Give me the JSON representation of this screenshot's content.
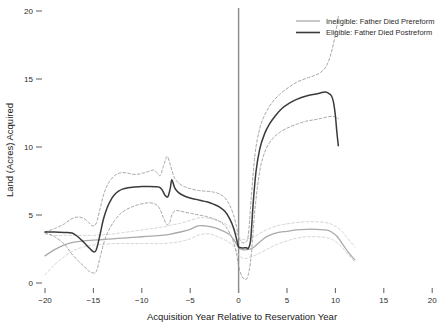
{
  "chart_data": {
    "type": "line",
    "title": "",
    "xlabel": "Acquisition Year Relative to Reservation Year",
    "ylabel": "Land (Acres) Acquired",
    "xlim": [
      -20,
      20
    ],
    "ylim": [
      0,
      20
    ],
    "xticks": [
      -20,
      -15,
      -10,
      -5,
      0,
      5,
      10,
      15,
      20
    ],
    "xtick_labels": [
      "−20",
      "−15",
      "−10",
      "−5",
      "0",
      "5",
      "10",
      "15",
      "20"
    ],
    "yticks": [
      0,
      5,
      10,
      15,
      20
    ],
    "ytick_labels": [
      "0",
      "5",
      "10",
      "15",
      "20"
    ],
    "grid": false,
    "legend_position": "top-right",
    "vertical_reference_line": {
      "x": 0,
      "label": "Reservation Year",
      "color": "#8a8a8a"
    },
    "colors": {
      "eligible": "#3a3a3a",
      "ineligible": "#aaaaaa",
      "eligible_ci": "#9b9b9b",
      "ineligible_ci": "#cfcfcf",
      "axis": "#4a4a4a",
      "text": "#2b2b2b"
    },
    "series": [
      {
        "name": "Ineligible: Father Died Prereform",
        "style": "solid",
        "color": "#aaaaaa",
        "x": [
          -20,
          -19,
          -18,
          -17,
          -16,
          -15,
          -14,
          -13,
          -12,
          -11,
          -10,
          -9,
          -8,
          -7,
          -6,
          -5,
          -4.2,
          -3.5,
          -3,
          -2,
          -1,
          -0.5,
          0,
          0.4,
          0.8,
          1.2,
          1.6,
          2,
          2.5,
          3,
          4,
          5,
          6,
          7,
          8,
          9,
          9.6,
          10.2,
          10.8,
          11.4,
          12
        ],
        "y": [
          2.0,
          2.45,
          2.8,
          3.0,
          3.1,
          3.15,
          3.2,
          3.25,
          3.3,
          3.35,
          3.4,
          3.45,
          3.5,
          3.6,
          3.75,
          3.95,
          4.2,
          4.2,
          4.15,
          3.95,
          3.6,
          3.2,
          2.6,
          2.45,
          2.45,
          2.5,
          2.65,
          2.9,
          3.2,
          3.45,
          3.7,
          3.8,
          3.9,
          3.95,
          3.95,
          3.9,
          3.75,
          3.4,
          2.8,
          2.2,
          1.7
        ]
      },
      {
        "name": "Eligible: Father Died Postreform",
        "style": "solid",
        "color": "#3a3a3a",
        "x": [
          -20,
          -19,
          -18,
          -17.2,
          -16.6,
          -16,
          -15.4,
          -15,
          -14.7,
          -14.3,
          -14,
          -13.6,
          -13.2,
          -12.8,
          -12.4,
          -12,
          -11.4,
          -10.8,
          -10,
          -9.2,
          -8.6,
          -8.2,
          -7.9,
          -7.6,
          -7.3,
          -7.05,
          -6.9,
          -6.6,
          -6.2,
          -5.6,
          -5,
          -4.4,
          -3.8,
          -3.2,
          -2.6,
          -2,
          -1.4,
          -0.9,
          -0.5,
          -0.2,
          0,
          0.25,
          0.5,
          0.8,
          1.0,
          1.25,
          1.5,
          1.8,
          2.2,
          2.7,
          3.2,
          3.8,
          4.5,
          5.2,
          6,
          7,
          8,
          8.6,
          9.0,
          9.3,
          9.6,
          9.8,
          10.0,
          10.15,
          10.3
        ],
        "y": [
          3.75,
          3.75,
          3.72,
          3.68,
          3.4,
          3.0,
          2.55,
          2.3,
          2.45,
          3.6,
          4.6,
          5.5,
          6.1,
          6.5,
          6.75,
          6.9,
          7.0,
          7.05,
          7.1,
          7.1,
          7.08,
          7.05,
          6.85,
          6.45,
          6.35,
          7.0,
          7.6,
          7.0,
          6.65,
          6.4,
          6.25,
          6.15,
          6.05,
          5.95,
          5.8,
          5.6,
          5.25,
          4.7,
          4.0,
          3.2,
          2.65,
          2.6,
          2.58,
          2.6,
          2.55,
          3.2,
          5.8,
          8.2,
          9.9,
          11.0,
          11.7,
          12.3,
          12.85,
          13.2,
          13.5,
          13.75,
          13.9,
          14.0,
          14.05,
          13.95,
          13.75,
          13.3,
          12.3,
          11.1,
          10.1
        ]
      }
    ],
    "confidence_bands": [
      {
        "name": "Ineligible: Father Died Prereform CI upper",
        "belongs_to": "Ineligible: Father Died Prereform",
        "style": "dashed",
        "color": "#cfcfcf",
        "x": [
          -20,
          -19,
          -18,
          -17,
          -16,
          -15,
          -14,
          -13,
          -12,
          -11,
          -10,
          -9,
          -8,
          -7,
          -6,
          -5,
          -4,
          -3,
          -2,
          -1,
          -0.4,
          0,
          0.5,
          1,
          1.6,
          2.2,
          3,
          4,
          5,
          6,
          7,
          8,
          9,
          9.8,
          10.6,
          11.3,
          12
        ],
        "y": [
          3.6,
          3.5,
          3.5,
          3.5,
          3.5,
          3.5,
          3.55,
          3.6,
          3.7,
          3.8,
          3.9,
          4.0,
          4.1,
          4.25,
          4.4,
          4.6,
          4.8,
          4.75,
          4.55,
          4.2,
          3.85,
          3.4,
          3.2,
          3.25,
          3.4,
          3.65,
          3.95,
          4.2,
          4.35,
          4.45,
          4.5,
          4.5,
          4.45,
          4.25,
          3.85,
          3.25,
          2.65
        ]
      },
      {
        "name": "Ineligible: Father Died Prereform CI lower",
        "belongs_to": "Ineligible: Father Died Prereform",
        "style": "dashed",
        "color": "#cfcfcf",
        "x": [
          -20,
          -19,
          -18,
          -17,
          -16,
          -15,
          -14,
          -13,
          -12,
          -11,
          -10,
          -9,
          -8,
          -7,
          -6,
          -5,
          -4,
          -3,
          -2,
          -1,
          -0.4,
          0,
          0.5,
          1,
          1.6,
          2.2,
          3,
          4,
          5,
          6,
          7,
          8,
          9,
          9.8,
          10.6,
          11.3,
          12
        ],
        "y": [
          0.6,
          1.35,
          1.95,
          2.4,
          2.65,
          2.8,
          2.85,
          2.9,
          2.9,
          2.9,
          2.9,
          2.9,
          2.9,
          2.95,
          3.05,
          3.25,
          3.55,
          3.6,
          3.35,
          3.0,
          2.6,
          2.05,
          1.8,
          1.85,
          2.0,
          2.2,
          2.5,
          2.85,
          3.1,
          3.3,
          3.4,
          3.4,
          3.35,
          3.15,
          2.7,
          2.1,
          1.55
        ]
      },
      {
        "name": "Eligible: Father Died Postreform CI upper",
        "belongs_to": "Eligible: Father Died Postreform",
        "style": "dashed",
        "color": "#9b9b9b",
        "x": [
          -20,
          -19,
          -18,
          -17.3,
          -16.6,
          -16,
          -15.5,
          -15.1,
          -14.7,
          -14.3,
          -13.9,
          -13.4,
          -12.8,
          -12.2,
          -11.6,
          -11,
          -10.4,
          -9.8,
          -9.3,
          -8.8,
          -8.4,
          -8.1,
          -7.8,
          -7.4,
          -7.1,
          -6.9,
          -6.6,
          -6.1,
          -5.5,
          -4.8,
          -4.1,
          -3.4,
          -2.7,
          -2,
          -1.4,
          -0.9,
          -0.5,
          -0.2,
          0,
          0.3,
          0.7,
          1.0,
          1.3,
          1.7,
          2.2,
          2.8,
          3.5,
          4.3,
          5.2,
          6.1,
          7,
          7.8,
          8.5,
          9.1,
          9.6,
          10,
          10.3
        ],
        "y": [
          3.75,
          4.0,
          4.35,
          4.7,
          4.85,
          4.75,
          4.45,
          4.2,
          4.4,
          5.5,
          6.6,
          7.4,
          7.9,
          8.1,
          8.1,
          8.0,
          8.0,
          8.1,
          8.2,
          8.3,
          8.1,
          7.9,
          8.5,
          9.3,
          8.8,
          8.3,
          7.7,
          7.3,
          7.05,
          6.9,
          6.8,
          6.75,
          6.7,
          6.55,
          6.25,
          5.7,
          4.95,
          4.1,
          3.4,
          3.0,
          3.0,
          3.5,
          6.2,
          9.5,
          11.4,
          12.5,
          13.3,
          13.9,
          14.4,
          14.8,
          15.05,
          15.25,
          15.5,
          16.0,
          17.0,
          18.3,
          19.6
        ]
      },
      {
        "name": "Eligible: Father Died Postreform CI lower",
        "belongs_to": "Eligible: Father Died Postreform",
        "style": "dashed",
        "color": "#9b9b9b",
        "x": [
          -20,
          -19,
          -18,
          -17.3,
          -16.6,
          -16,
          -15.5,
          -15.1,
          -14.7,
          -14.3,
          -13.9,
          -13.4,
          -12.8,
          -12.2,
          -11.6,
          -11,
          -10.4,
          -9.8,
          -9.3,
          -8.8,
          -8.4,
          -8.1,
          -7.8,
          -7.4,
          -7.1,
          -6.9,
          -6.6,
          -6.1,
          -5.5,
          -4.8,
          -4.1,
          -3.4,
          -2.7,
          -2,
          -1.4,
          -0.9,
          -0.5,
          -0.2,
          0,
          0.3,
          0.7,
          1.0,
          1.3,
          1.7,
          2.2,
          2.8,
          3.5,
          4.3,
          5.2,
          6.1,
          7,
          7.8,
          8.5,
          9.1,
          9.6,
          10,
          10.25,
          10.3
        ],
        "y": [
          3.7,
          3.4,
          2.85,
          2.2,
          1.65,
          1.25,
          0.9,
          0.75,
          0.85,
          1.9,
          3.0,
          3.9,
          4.6,
          5.1,
          5.4,
          5.6,
          5.75,
          5.85,
          5.9,
          5.85,
          5.7,
          5.4,
          4.85,
          4.3,
          4.5,
          5.0,
          5.3,
          5.3,
          5.2,
          5.1,
          5.0,
          4.9,
          4.75,
          4.55,
          4.2,
          3.65,
          2.95,
          2.1,
          1.25,
          0.55,
          0.25,
          0.6,
          2.0,
          5.5,
          8.3,
          9.8,
          10.6,
          11.1,
          11.45,
          11.7,
          11.9,
          12.0,
          12.1,
          12.2,
          12.25,
          12.2,
          12.1,
          12.1
        ]
      }
    ]
  },
  "legend": {
    "entries": [
      {
        "label": "Ineligible: Father Died Prereform",
        "color": "#aaaaaa"
      },
      {
        "label": "Eligible: Father Died Postreform",
        "color": "#3a3a3a"
      }
    ]
  }
}
